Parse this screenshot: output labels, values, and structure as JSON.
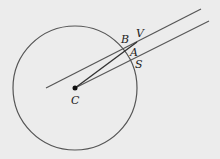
{
  "diagram": {
    "background": "#ececec",
    "stroke_color": "#444444",
    "circle": {
      "cx": 75,
      "cy": 88,
      "r": 62
    },
    "center_point": {
      "x": 75,
      "y": 88,
      "label": "C"
    },
    "lines": [
      {
        "name": "upper-parallel-line",
        "x1": 46,
        "y1": 88,
        "x2": 201,
        "y2": 9
      },
      {
        "name": "lower-parallel-line",
        "x1": 75,
        "y1": 88,
        "x2": 209,
        "y2": 21
      },
      {
        "name": "radius-to-v",
        "x1": 75,
        "y1": 88,
        "x2": 137,
        "y2": 42
      }
    ],
    "labels": {
      "B": "B",
      "V": "V",
      "A": "A",
      "S": "S",
      "C": "C"
    }
  }
}
